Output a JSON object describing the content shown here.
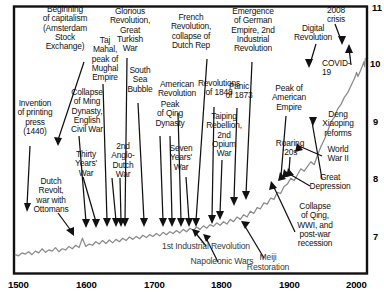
{
  "chart_data": {
    "type": "line",
    "title": "",
    "subtitle": "",
    "xlabel": "",
    "ylabel": "",
    "xlim": [
      1500,
      2022
    ],
    "ylim": [
      6.72,
      11.22
    ],
    "xticks": [
      "1500",
      "1600",
      "1700",
      "1800",
      "1900",
      "2000"
    ],
    "xtick_values": [
      1500,
      1600,
      1700,
      1800,
      1900,
      2000
    ],
    "yticks": [
      "7",
      "8",
      "9",
      "10",
      "11"
    ],
    "ytick_values": [
      7,
      8,
      9,
      10,
      11
    ],
    "ytick_side": "right",
    "grid": false,
    "legend": "none",
    "series": [
      {
        "name": "world output (log10)",
        "color": "#8a8a8a",
        "x": [
          1500,
          1505,
          1510,
          1515,
          1520,
          1525,
          1530,
          1535,
          1540,
          1545,
          1550,
          1555,
          1560,
          1565,
          1570,
          1575,
          1580,
          1585,
          1590,
          1595,
          1600,
          1605,
          1610,
          1615,
          1620,
          1625,
          1630,
          1635,
          1640,
          1645,
          1650,
          1655,
          1660,
          1665,
          1670,
          1675,
          1680,
          1685,
          1690,
          1695,
          1700,
          1705,
          1710,
          1715,
          1720,
          1725,
          1730,
          1735,
          1740,
          1745,
          1750,
          1755,
          1760,
          1765,
          1770,
          1775,
          1780,
          1785,
          1790,
          1795,
          1800,
          1805,
          1810,
          1815,
          1820,
          1825,
          1830,
          1835,
          1840,
          1845,
          1850,
          1855,
          1860,
          1865,
          1870,
          1875,
          1880,
          1885,
          1890,
          1895,
          1900,
          1905,
          1910,
          1915,
          1920,
          1925,
          1930,
          1935,
          1940,
          1945,
          1950,
          1955,
          1960,
          1965,
          1970,
          1975,
          1980,
          1985,
          1990,
          1995,
          2000,
          2005,
          2008,
          2010,
          2015,
          2019,
          2020,
          2021
        ],
        "y": [
          7.02,
          7.0,
          7.05,
          7.03,
          7.07,
          7.02,
          7.08,
          7.05,
          7.12,
          7.06,
          7.1,
          7.08,
          7.14,
          7.07,
          7.12,
          7.1,
          7.16,
          7.12,
          7.18,
          7.14,
          7.3,
          7.16,
          7.2,
          7.18,
          7.24,
          7.2,
          7.26,
          7.21,
          7.27,
          7.22,
          7.28,
          7.24,
          7.3,
          7.26,
          7.32,
          7.28,
          7.33,
          7.29,
          7.35,
          7.31,
          7.36,
          7.33,
          7.38,
          7.34,
          7.4,
          7.36,
          7.41,
          7.38,
          7.43,
          7.39,
          7.45,
          7.41,
          7.47,
          7.43,
          7.49,
          7.45,
          7.51,
          7.47,
          7.53,
          7.5,
          7.56,
          7.52,
          7.58,
          7.54,
          7.62,
          7.58,
          7.66,
          7.62,
          7.7,
          7.66,
          7.76,
          7.72,
          7.82,
          7.8,
          7.9,
          7.88,
          7.98,
          7.96,
          8.08,
          8.06,
          8.18,
          8.22,
          8.32,
          8.28,
          8.38,
          8.48,
          8.44,
          8.52,
          8.6,
          8.55,
          8.72,
          8.86,
          8.98,
          9.12,
          9.28,
          9.36,
          9.5,
          9.58,
          9.7,
          9.78,
          9.9,
          10.02,
          10.12,
          10.05,
          10.18,
          10.3,
          10.22,
          10.36
        ]
      }
    ],
    "annotations": [
      {
        "id": "beginning-of-capitalism",
        "text": "Beginning\nof capitalism\n(Amsterdam\nStock\nExchange)"
      },
      {
        "id": "invention-of-printing-press",
        "text": "Invention\nof printing\npress\n(1440)"
      },
      {
        "id": "dutch-revolt",
        "text": "Dutch\nRevolt,\nwar with\nOttomans"
      },
      {
        "id": "collapse-of-ming",
        "text": "Collapse\nof Ming\nDynasty,\nEnglish\nCivil War"
      },
      {
        "id": "thirty-years-war",
        "text": "Thirty\nYears'\nWar"
      },
      {
        "id": "taj-mahal",
        "text": "Taj\nMahal,\npeak of\nMughal\nEmpire"
      },
      {
        "id": "second-anglo-dutch-war",
        "text": "2nd\nAnglo-\nDutch\nWar"
      },
      {
        "id": "glorious-revolution",
        "text": "Glorious\nRevolution,\nGreat\nTurkish\nWar"
      },
      {
        "id": "south-sea-bubble",
        "text": "South\nSea\nBubble"
      },
      {
        "id": "peak-of-qing-dynasty",
        "text": "Peak\nof Qing\nDynasty"
      },
      {
        "id": "seven-years-war",
        "text": "Seven\nYears'\nWar"
      },
      {
        "id": "american-revolution",
        "text": "American\nRevolution"
      },
      {
        "id": "french-revolution",
        "text": "French\nRevolution,\ncollapse of\nDutch Rep"
      },
      {
        "id": "first-industrial-revolution",
        "text": "1st Industrial Revolution"
      },
      {
        "id": "napoleonic-wars",
        "text": "Napoleonic Wars"
      },
      {
        "id": "revolutions-of-1848",
        "text": "Revolutions\nof 1848"
      },
      {
        "id": "taiping-rebellion",
        "text": "Taiping\nRebellion,\n2nd\nOpium\nWar"
      },
      {
        "id": "emergence-of-german-empire",
        "text": "Emergence\nof German\nEmpire, 2nd\nIndustrial\nRevolution"
      },
      {
        "id": "panic-of-1873",
        "text": "Panic\nof 1873"
      },
      {
        "id": "meiji-restoration",
        "text": "Meiji\nRestoration"
      },
      {
        "id": "peak-of-american-empire",
        "text": "Peak of\nAmerican\nEmpire"
      },
      {
        "id": "collapse-of-qing",
        "text": "Collapse\nof Qing,\nWWI, and\npost-war\nrecession"
      },
      {
        "id": "roaring-twenties",
        "text": "Roaring\n'20s"
      },
      {
        "id": "great-depression",
        "text": "Great\nDepression"
      },
      {
        "id": "world-war-ii",
        "text": "World\nWar II"
      },
      {
        "id": "deng-xiaoping-reforms",
        "text": "Deng\nXiaoping\nreforms"
      },
      {
        "id": "digital-revolution",
        "text": "Digital\nRevolution"
      },
      {
        "id": "crisis-2008",
        "text": "2008\ncrisis"
      },
      {
        "id": "covid-19",
        "text": "COVID-\n19"
      }
    ]
  },
  "axis": {
    "x": {
      "ticks": [
        "1500",
        "1600",
        "1700",
        "1800",
        "1900",
        "2000"
      ]
    },
    "y": {
      "ticks": [
        "11",
        "10",
        "9",
        "8",
        "7"
      ]
    }
  }
}
